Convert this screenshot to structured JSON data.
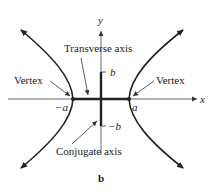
{
  "figure": {
    "caption": "b",
    "colors": {
      "ink": "#222222",
      "axis": "#555555",
      "background": "#ffffff"
    }
  },
  "axes": {
    "x_label": "x",
    "y_label": "y"
  },
  "points": {
    "left_vertex": "−a",
    "right_vertex": "a",
    "top_conjugate": "b",
    "bottom_conjugate": "−b"
  },
  "annotations": {
    "transverse_axis": "Transverse axis",
    "conjugate_axis": "Conjugate axis",
    "vertex_left": "Vertex",
    "vertex_right": "Vertex"
  }
}
